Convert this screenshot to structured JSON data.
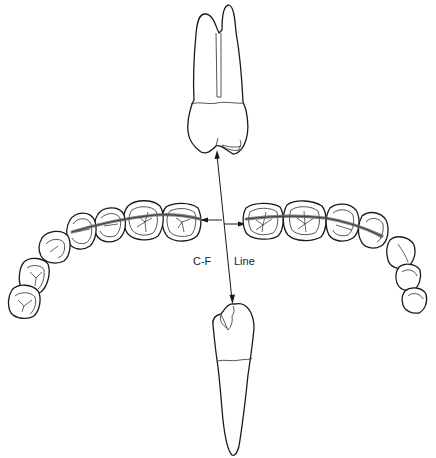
{
  "diagram": {
    "type": "dental-illustration",
    "labels": {
      "cf_left": "C-F",
      "cf_right": "Line"
    },
    "elements": {
      "upper_tooth": "maxillary-premolar-proximal-view",
      "lower_tooth": "mandibular-premolar-proximal-view",
      "left_arch": "maxillary-posterior-arch-occlusal-view",
      "right_arch": "mandibular-posterior-arch-occlusal-view",
      "central_line": "central-fossa-line-vertical-double-arrow",
      "horizontal_arrows": "arrows-pointing-to-arch-lines"
    },
    "colors": {
      "line": "#1a1a1a",
      "band": "#6b6b6b",
      "background": "#ffffff"
    }
  }
}
